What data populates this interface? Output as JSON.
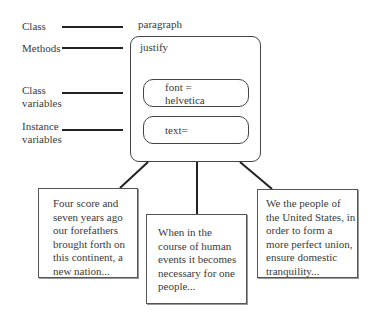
{
  "legend": {
    "class_label": "Class",
    "methods_label": "Methods",
    "class_variables_label": "Class variables",
    "class_variables_line1": "Class",
    "class_variables_line2": "variables",
    "instance_variables_line1": "Instance",
    "instance_variables_line2": "variables"
  },
  "object": {
    "class_name": "paragraph",
    "method": "justify",
    "class_variable_line1": "font =",
    "class_variable_line2": "helvetica",
    "instance_variable": "text="
  },
  "instances": [
    {
      "lines": [
        "Four score and",
        "seven years ago",
        "our forefathers",
        "brought forth on",
        "this continent, a",
        "new nation..."
      ]
    },
    {
      "lines": [
        "When in the",
        "course of human",
        "events it becomes",
        "necessary for one",
        "people..."
      ]
    },
    {
      "lines": [
        "We the people of",
        "the United States, in",
        "order to form a",
        "more perfect union,",
        "ensure domestic",
        "tranquility..."
      ]
    }
  ],
  "colors": {
    "line": "#222222",
    "border": "#444444",
    "text": "#3a3a3a"
  }
}
